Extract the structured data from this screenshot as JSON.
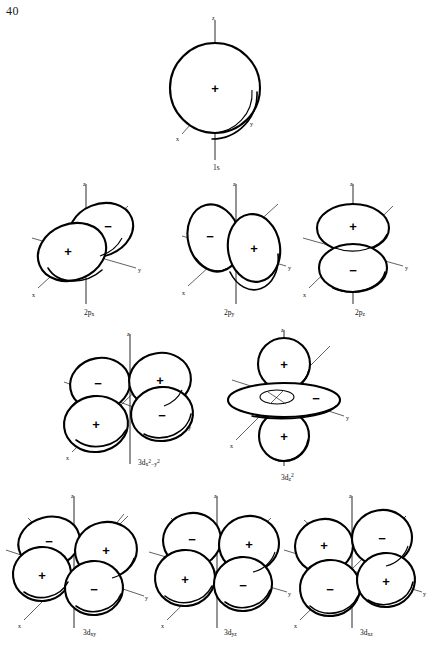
{
  "page": {
    "number": "40"
  },
  "axes": {
    "z": "z",
    "y": "y",
    "x": "x"
  },
  "signs": {
    "positive": "+",
    "negative": "−"
  },
  "orbitals": [
    {
      "id": "1s",
      "caption_main": "1s",
      "caption_sub": "",
      "caption_sup": "",
      "type": "sphere",
      "lobes": [
        {
          "name": "sphere",
          "sign": "+"
        }
      ]
    },
    {
      "id": "2px",
      "caption_main": "2p",
      "caption_sub": "x",
      "caption_sup": "",
      "type": "p",
      "lobes": [
        {
          "name": "front-lower-left",
          "sign": "+"
        },
        {
          "name": "back-upper-right",
          "sign": "−"
        }
      ]
    },
    {
      "id": "2py",
      "caption_main": "2p",
      "caption_sub": "y",
      "caption_sup": "",
      "type": "p",
      "lobes": [
        {
          "name": "right",
          "sign": "+"
        },
        {
          "name": "left",
          "sign": "−"
        }
      ]
    },
    {
      "id": "2pz",
      "caption_main": "2p",
      "caption_sub": "z",
      "caption_sup": "",
      "type": "p",
      "lobes": [
        {
          "name": "upper",
          "sign": "+"
        },
        {
          "name": "lower",
          "sign": "−"
        }
      ]
    },
    {
      "id": "3dx2-y2",
      "caption_main": "3d",
      "caption_sub": "x",
      "caption_sup": "2",
      "caption_sub2": "−y",
      "caption_sup2": "2",
      "type": "d-cloverleaf",
      "lobes": [
        {
          "name": "upper-left",
          "sign": "−"
        },
        {
          "name": "upper-right",
          "sign": "+"
        },
        {
          "name": "lower-left",
          "sign": "+"
        },
        {
          "name": "lower-right",
          "sign": "−"
        }
      ]
    },
    {
      "id": "3dz2",
      "caption_main": "3d",
      "caption_sub": "z",
      "caption_sup": "2",
      "type": "d-z2",
      "lobes": [
        {
          "name": "top-lobe",
          "sign": "+"
        },
        {
          "name": "bottom-lobe",
          "sign": "+"
        },
        {
          "name": "torus",
          "sign": "−"
        }
      ]
    },
    {
      "id": "3dxy",
      "caption_main": "3d",
      "caption_sub": "xy",
      "caption_sup": "",
      "type": "d-cloverleaf",
      "lobes": [
        {
          "name": "upper-left",
          "sign": "−"
        },
        {
          "name": "upper-right",
          "sign": "+"
        },
        {
          "name": "lower-left",
          "sign": "+"
        },
        {
          "name": "lower-right",
          "sign": "−"
        }
      ]
    },
    {
      "id": "3dyz",
      "caption_main": "3d",
      "caption_sub": "yz",
      "caption_sup": "",
      "type": "d-cloverleaf",
      "lobes": [
        {
          "name": "upper-left",
          "sign": "−"
        },
        {
          "name": "upper-right",
          "sign": "+"
        },
        {
          "name": "lower-left",
          "sign": "+"
        },
        {
          "name": "lower-right",
          "sign": "−"
        }
      ]
    },
    {
      "id": "3dxz",
      "caption_main": "3d",
      "caption_sub": "xz",
      "caption_sup": "",
      "type": "d-cloverleaf",
      "lobes": [
        {
          "name": "upper-left",
          "sign": "+"
        },
        {
          "name": "upper-right",
          "sign": "−"
        },
        {
          "name": "lower-left",
          "sign": "−"
        },
        {
          "name": "lower-right",
          "sign": "+"
        }
      ]
    }
  ]
}
